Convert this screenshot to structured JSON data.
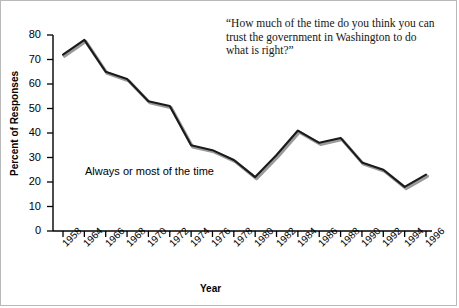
{
  "figure": {
    "background_color": "#ffffff",
    "border_color": "#b9b9b9",
    "annotation": "Always or most of the time",
    "quote": "“How much of the time do you think you can trust the government in Washington to do what is right?”"
  },
  "chart_data": {
    "type": "line",
    "title": "",
    "xlabel": "Year",
    "ylabel": "Percent of Responses",
    "ylim": [
      0,
      80
    ],
    "yticks": [
      0,
      10,
      20,
      30,
      40,
      50,
      60,
      70,
      80
    ],
    "grid": false,
    "legend_position": "inline-annotation",
    "series_name": "Always or most of the time",
    "line_color": "#1a1a1a",
    "shadow_color": "#9a9a9a",
    "categories": [
      "1958",
      "1964",
      "1966",
      "1968",
      "1970",
      "1972",
      "1974",
      "1976",
      "1978",
      "1980",
      "1982",
      "1984",
      "1986",
      "1988",
      "1990",
      "1992",
      "1994",
      "1996"
    ],
    "x": [
      1958,
      1964,
      1966,
      1968,
      1970,
      1972,
      1974,
      1976,
      1978,
      1980,
      1982,
      1984,
      1986,
      1988,
      1990,
      1992,
      1994,
      1996
    ],
    "values": [
      72,
      78,
      65,
      62,
      53,
      51,
      35,
      33,
      29,
      22,
      31,
      41,
      36,
      38,
      28,
      25,
      18,
      23
    ],
    "xtick_labels": [
      "1958",
      "1964",
      "1966",
      "1968",
      "1970",
      "1972",
      "1974",
      "1976",
      "1978",
      "1980",
      "1982",
      "1984",
      "1986",
      "1988",
      "1990",
      "1992",
      "1994",
      "1996"
    ],
    "ytick_labels": [
      "0",
      "10",
      "20",
      "30",
      "40",
      "50",
      "60",
      "70",
      "80"
    ]
  }
}
